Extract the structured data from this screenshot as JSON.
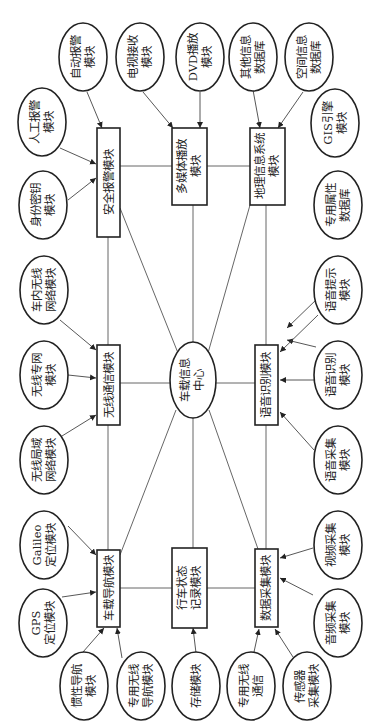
{
  "diagram": {
    "orientation": "rotated-90-ccw",
    "center": {
      "line1": "车载信息",
      "line2": "中心"
    },
    "modules": {
      "security_alarm": "安全报警模块",
      "multimedia": {
        "line1": "多媒体播放",
        "line2": "模块"
      },
      "gis": {
        "line1": "地理信息系统",
        "line2": "模块"
      },
      "wireless_comm": "无线通信模块",
      "speech_recognition": "语音识别模块",
      "navigation": "车载导航模块",
      "driving_record": {
        "line1": "行车状态",
        "line2": "记录模块"
      },
      "data_acquisition": "数据采集模块"
    },
    "submodules": {
      "auto_alarm": {
        "line1": "自动报警",
        "line2": "模块"
      },
      "manual_alarm": {
        "line1": "人工报警",
        "line2": "模块"
      },
      "identity_key": {
        "line1": "身份密钥",
        "line2": "模块"
      },
      "tv_receive": {
        "line1": "电视接收",
        "line2": "模块"
      },
      "dvd_play": {
        "line1": "DVD播放",
        "line2": "模块"
      },
      "other_info_db": {
        "line1": "其他信息",
        "line2": "数据库"
      },
      "spatial_info_db": {
        "line1": "空间信息",
        "line2": "数据库"
      },
      "gis_engine": {
        "line1": "GIS引擎",
        "line2": "模块"
      },
      "special_attr_db": {
        "line1": "专用属性",
        "line2": "数据库"
      },
      "in_car_wireless": {
        "line1": "车内无线",
        "line2": "网络模块"
      },
      "wireless_private": {
        "line1": "无线专网",
        "line2": "模块"
      },
      "wlan": {
        "line1": "无线局域",
        "line2": "网络模块"
      },
      "voice_prompt": {
        "line1": "语音提示",
        "line2": "模块"
      },
      "voice_recognition": {
        "line1": "语音识别",
        "line2": "模块"
      },
      "voice_capture": {
        "line1": "语音采集",
        "line2": "模块"
      },
      "galileo": {
        "line1": "Galileo",
        "line2": "定位模块"
      },
      "gps": {
        "line1": "GPS",
        "line2": "定位模块"
      },
      "inertial_nav": {
        "line1": "惯性导航",
        "line2": "模块"
      },
      "dedicated_wireless_nav": {
        "line1": "专用无线",
        "line2": "导航模块"
      },
      "storage": {
        "line1": "存储模块"
      },
      "dedicated_wireless_comm": {
        "line1": "专用无线",
        "line2": "通信"
      },
      "sensor_capture": {
        "line1": "传感器",
        "line2": "采集模块"
      },
      "video_capture": {
        "line1": "视频采集",
        "line2": "模块"
      },
      "audio_capture": {
        "line1": "音频采集",
        "line2": "模块"
      }
    }
  }
}
